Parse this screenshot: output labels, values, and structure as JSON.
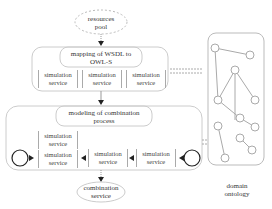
{
  "nodes": {
    "resources_pool": {
      "line1": "resources",
      "line2": "pool"
    },
    "mapping": {
      "line1": "mapping of WSDL to",
      "line2": "OWL-S"
    },
    "mapping_services": [
      {
        "line1": "simulation",
        "line2": "service"
      },
      {
        "line1": "simulation",
        "line2": "service"
      },
      {
        "line1": "simulation",
        "line2": "service"
      }
    ],
    "modeling": {
      "line1": "modeling of combination",
      "line2": "process"
    },
    "process_services": {
      "parallel": [
        {
          "line1": "simulation",
          "line2": "service"
        },
        {
          "line1": "simulation",
          "line2": "service"
        }
      ],
      "seq1": {
        "line1": "simulation",
        "line2": "service"
      },
      "seq2": {
        "line1": "simulation",
        "line2": "service"
      }
    },
    "combination_service": {
      "line1": "combination",
      "line2": "service"
    },
    "domain_ontology": {
      "line1": "domain",
      "line2": "ontology"
    }
  },
  "colors": {
    "stroke": "#999999",
    "dark": "#222222",
    "text": "#333333"
  }
}
